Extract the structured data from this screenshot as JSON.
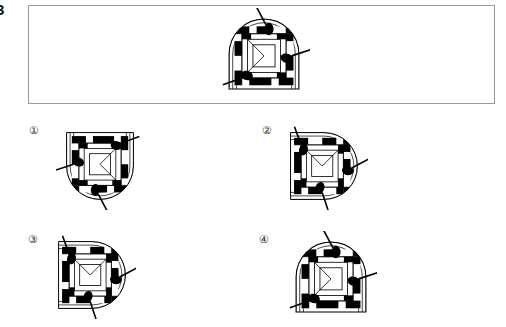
{
  "question": {
    "number": "3",
    "type": "figure-rotation-multiple-choice"
  },
  "stimulus": {
    "box": {
      "x": 28,
      "y": 5,
      "width": 467,
      "height": 99
    },
    "figure": {
      "name": "stimulus-figure",
      "x": 218,
      "y": 8,
      "width": 92,
      "height": 92,
      "rotation_deg": 0,
      "description": "arch-shaped tile with nested square grid of black and white cells, three dart markers"
    }
  },
  "options": [
    {
      "id": "1",
      "label": "①",
      "label_x": 29,
      "label_y": 124,
      "figure": {
        "x": 56,
        "y": 122,
        "width": 88,
        "height": 88,
        "rotation_deg": 180
      }
    },
    {
      "id": "2",
      "label": "②",
      "label_x": 262,
      "label_y": 124,
      "figure": {
        "x": 280,
        "y": 122,
        "width": 88,
        "height": 88,
        "rotation_deg": 90
      }
    },
    {
      "id": "3",
      "label": "③",
      "label_x": 28,
      "label_y": 233,
      "figure": {
        "x": 48,
        "y": 231,
        "width": 88,
        "height": 88,
        "rotation_deg": 90
      }
    },
    {
      "id": "4",
      "label": "④",
      "label_x": 259,
      "label_y": 233,
      "figure": {
        "x": 285,
        "y": 231,
        "width": 92,
        "height": 92,
        "rotation_deg": 0
      }
    }
  ],
  "colors": {
    "ink": "#000000",
    "paper": "#ffffff",
    "box_border": "#9a9a9a",
    "label_text": "#2b2b2b"
  }
}
